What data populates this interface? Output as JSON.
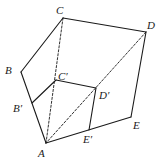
{
  "diagram": {
    "type": "geometry-figure",
    "colors": {
      "stroke": "#1a1a1a",
      "background": "#ffffff"
    },
    "points": {
      "A": {
        "label": "A",
        "x": 46,
        "y": 143,
        "lx": 38,
        "ly": 157
      },
      "B": {
        "label": "B",
        "x": 21,
        "y": 72,
        "lx": 5,
        "ly": 74
      },
      "C": {
        "label": "C",
        "x": 63,
        "y": 18,
        "lx": 56,
        "ly": 14
      },
      "D": {
        "label": "D",
        "x": 146,
        "y": 32,
        "lx": 147,
        "ly": 29
      },
      "E": {
        "label": "E",
        "x": 131,
        "y": 117,
        "lx": 133,
        "ly": 129
      },
      "B1": {
        "label": "B′",
        "x": 32,
        "y": 103,
        "lx": 13,
        "ly": 112
      },
      "C1": {
        "label": "C′",
        "x": 56,
        "y": 80,
        "lx": 58,
        "ly": 80
      },
      "D1": {
        "label": "D′",
        "x": 96,
        "y": 88,
        "lx": 99,
        "ly": 99
      },
      "E1": {
        "label": "E′",
        "x": 89,
        "y": 130,
        "lx": 83,
        "ly": 143
      }
    },
    "edges": [
      {
        "from": "C",
        "to": "D",
        "style": "solid"
      },
      {
        "from": "C",
        "to": "B",
        "style": "solid"
      },
      {
        "from": "B",
        "to": "A",
        "style": "solid"
      },
      {
        "from": "A",
        "to": "E",
        "style": "solid"
      },
      {
        "from": "E",
        "to": "D",
        "style": "solid"
      },
      {
        "from": "B1",
        "to": "C1",
        "style": "solid"
      },
      {
        "from": "C1",
        "to": "D1",
        "style": "solid"
      },
      {
        "from": "D1",
        "to": "E1",
        "style": "solid"
      },
      {
        "from": "C",
        "to": "A",
        "style": "dashed"
      },
      {
        "from": "D",
        "to": "A",
        "style": "dashed"
      }
    ]
  }
}
